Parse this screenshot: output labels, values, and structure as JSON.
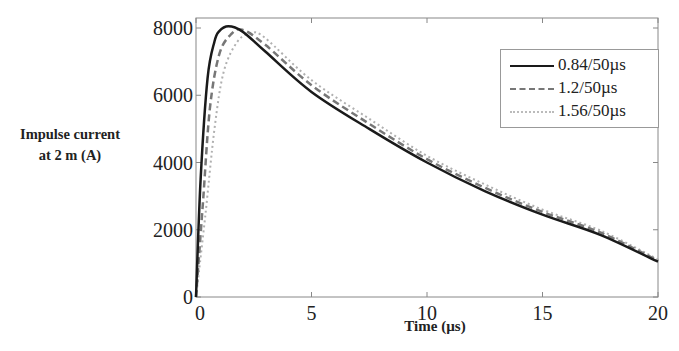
{
  "chart_data": {
    "type": "line",
    "title": "",
    "xlabel": "Time (µs)",
    "ylabel": "Impulse current at 2 m (A)",
    "ylabel_lines": [
      "Impulse current",
      "at 2 m (A)"
    ],
    "xlim": [
      0,
      20
    ],
    "ylim": [
      0,
      8300
    ],
    "xticks": [
      0,
      5,
      10,
      15,
      20
    ],
    "yticks": [
      0,
      2000,
      4000,
      6000,
      8000
    ],
    "grid": false,
    "legend_position": "upper right",
    "series": [
      {
        "name": "0.84/50µs",
        "style": "solid",
        "color": "#1a1a1a",
        "x": [
          0,
          0.2,
          0.5,
          0.8,
          1.0,
          1.4,
          2.0,
          3.0,
          5.0,
          7.5,
          10.0,
          12.5,
          15.0,
          17.5,
          20.0
        ],
        "y": [
          0,
          3500,
          6500,
          7600,
          7900,
          8050,
          7900,
          7300,
          6100,
          5000,
          4000,
          3150,
          2450,
          1850,
          1050
        ]
      },
      {
        "name": "1.2/50µs",
        "style": "dashed",
        "color": "#777777",
        "x": [
          0,
          0.3,
          0.6,
          1.0,
          1.5,
          2.0,
          3.0,
          5.0,
          7.5,
          10.0,
          12.5,
          15.0,
          17.5,
          20.0
        ],
        "y": [
          0,
          2800,
          5600,
          7200,
          7800,
          7950,
          7500,
          6300,
          5150,
          4100,
          3250,
          2530,
          1920,
          1080
        ]
      },
      {
        "name": "1.56/50µs",
        "style": "dotted",
        "color": "#b0b0b0",
        "x": [
          0,
          0.4,
          0.8,
          1.2,
          1.8,
          2.4,
          3.0,
          5.0,
          7.5,
          10.0,
          12.5,
          15.0,
          17.5,
          20.0
        ],
        "y": [
          0,
          2400,
          5000,
          6700,
          7600,
          7850,
          7700,
          6450,
          5300,
          4200,
          3350,
          2600,
          1980,
          1120
        ]
      }
    ]
  },
  "labels": {
    "ylabel_line1": "Impulse current",
    "ylabel_line2": "at 2 m (A)",
    "xlabel": "Time (µs)",
    "legend": [
      "0.84/50µs",
      "1.2/50µs",
      "1.56/50µs"
    ]
  }
}
